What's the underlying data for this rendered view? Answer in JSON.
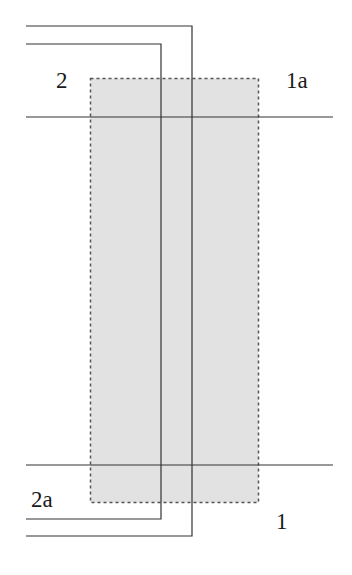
{
  "diagram": {
    "shaded_region": {
      "x": 90,
      "y": 78,
      "width": 168,
      "height": 424,
      "fill": "#e2e2e2",
      "border": "#555555",
      "border_style": "dotted"
    },
    "horizontal_lines": [
      {
        "id": "top-crossing-line",
        "y": 117,
        "x1": 26,
        "x2": 333
      },
      {
        "id": "bottom-crossing-line",
        "y": 465,
        "x1": 26,
        "x2": 333
      }
    ],
    "conductor_paths": [
      {
        "id": "outer-path",
        "points": "26,26 192,26 192,536 26,536"
      },
      {
        "id": "inner-path",
        "points": "26,44 161,44 161,519 26,519"
      }
    ],
    "labels": [
      {
        "id": "label-2",
        "text": "2",
        "x": 56,
        "y": 88
      },
      {
        "id": "label-1a",
        "text": "1a",
        "x": 286,
        "y": 88
      },
      {
        "id": "label-2a",
        "text": "2a",
        "x": 31,
        "y": 507
      },
      {
        "id": "label-1",
        "text": "1",
        "x": 276,
        "y": 529
      }
    ],
    "line_color": "#333333"
  }
}
